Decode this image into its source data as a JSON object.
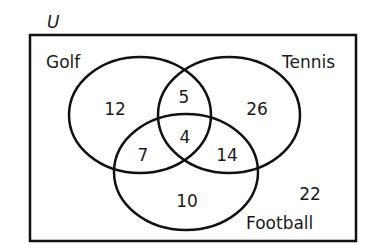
{
  "diagram": {
    "type": "venn-3",
    "universe_label": "U",
    "sets": [
      {
        "name": "Golf"
      },
      {
        "name": "Tennis"
      },
      {
        "name": "Football"
      }
    ],
    "regions": {
      "golf_only": "12",
      "tennis_only": "26",
      "football_only": "10",
      "golf_tennis_only": "5",
      "golf_football_only": "7",
      "tennis_football_only": "14",
      "all_three": "4",
      "outside": "22"
    },
    "colors": {
      "stroke": "#111111",
      "background": "#ffffff"
    }
  }
}
